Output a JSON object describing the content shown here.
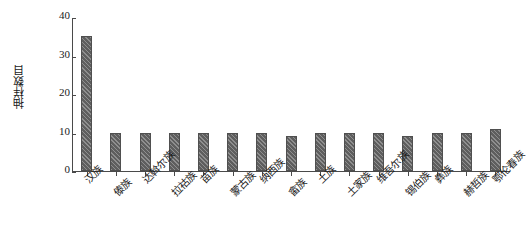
{
  "chart_data": {
    "type": "bar",
    "title": "",
    "xlabel": "",
    "ylabel": "抽样数目",
    "ylim": [
      0,
      40
    ],
    "yticks": [
      "0",
      "10",
      "20",
      "30",
      "40"
    ],
    "grid": false,
    "legend": "none",
    "bar_color": "#5e5e5e",
    "bar_hatch": "diagonal",
    "categories": [
      "汉族",
      "傣族",
      "达斡尔族",
      "拉祜族",
      "苗族",
      "蒙古族",
      "纳西族",
      "畲族",
      "土族",
      "土家族",
      "维吾尔族",
      "锡伯族",
      "彝族",
      "赫哲族",
      "鄂伦春族"
    ],
    "values": [
      35,
      10,
      10,
      10,
      10,
      10,
      10,
      9,
      10,
      10,
      10,
      9,
      10,
      10,
      11
    ]
  }
}
